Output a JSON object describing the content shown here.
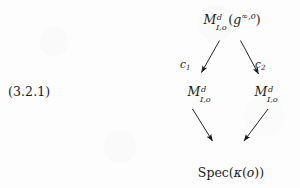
{
  "figure": {
    "equation_tag": "(3.2.1)",
    "background_color": "#fdfdfd",
    "ink_color": "#1a1a1a",
    "type": "commutative-diagram"
  },
  "nodes": {
    "top": {
      "symbol": "M",
      "superscript": "d",
      "subscript": "I,o",
      "argument_open": "(",
      "argument_symbol": "g",
      "argument_superscript": "∞,o",
      "argument_close": ")",
      "plain": "M^d_{I,o}(g^{∞,o})"
    },
    "middle_left": {
      "symbol": "M",
      "superscript": "d",
      "subscript": "I,o",
      "plain": "M^d_{I,o}"
    },
    "middle_right": {
      "symbol": "M",
      "superscript": "d",
      "subscript": "I,o",
      "plain": "M^d_{I,o}"
    },
    "bottom": {
      "operator": "Spec",
      "open": "(",
      "kappa": "κ",
      "inner_open": "(",
      "inner_symbol": "o",
      "inner_close": ")",
      "close": ")",
      "plain": "Spec(κ(o))"
    }
  },
  "arrows": [
    {
      "name": "c1",
      "label": "c",
      "label_subscript": "1",
      "from": "top",
      "to": "middle_left"
    },
    {
      "name": "c2",
      "label": "c",
      "label_subscript": "2",
      "from": "top",
      "to": "middle_right"
    },
    {
      "name": "structure-left",
      "label": "",
      "label_subscript": "",
      "from": "middle_left",
      "to": "bottom"
    },
    {
      "name": "structure-right",
      "label": "",
      "label_subscript": "",
      "from": "middle_right",
      "to": "bottom"
    }
  ]
}
